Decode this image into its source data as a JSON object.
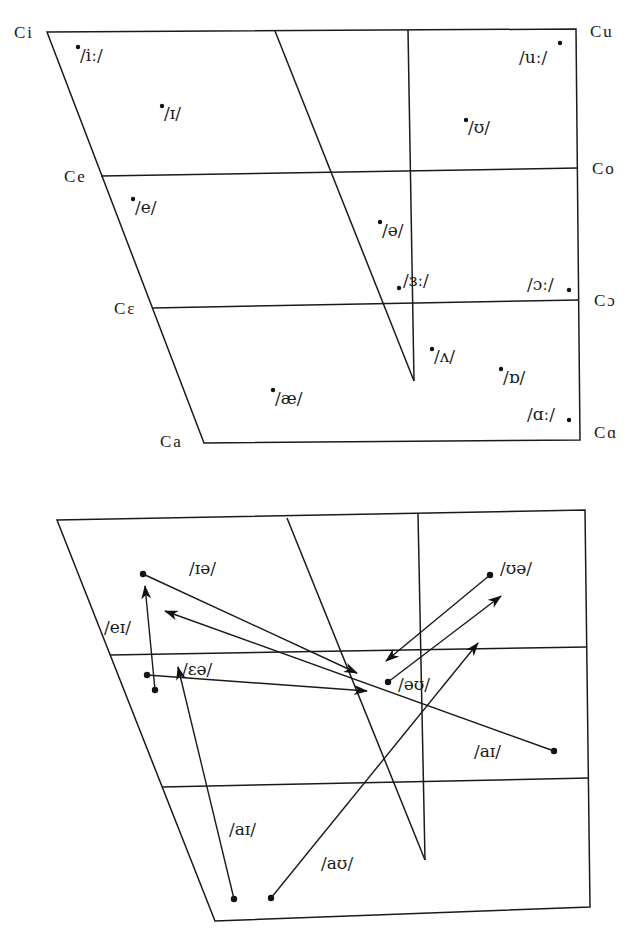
{
  "monophthong_chart": {
    "cardinals": {
      "ci": "Ci",
      "ce": "Ce",
      "cepsilon": "Cε",
      "ca_front": "Ca",
      "cu": "Cu",
      "co": "Co",
      "copen": "Cɔ",
      "ca_back": "Cɑ"
    },
    "vowels": [
      {
        "symbol": "/iː/",
        "x": 78,
        "y": 45
      },
      {
        "symbol": "/ɪ/",
        "x": 162,
        "y": 105
      },
      {
        "symbol": "/e/",
        "x": 132,
        "y": 198
      },
      {
        "symbol": "/ʊ/",
        "x": 465,
        "y": 120
      },
      {
        "symbol": "/uː/",
        "x": 560,
        "y": 43
      },
      {
        "symbol": "/ə/",
        "x": 380,
        "y": 225
      },
      {
        "symbol": "/ɜː/",
        "x": 399,
        "y": 286
      },
      {
        "symbol": "/ɔː/",
        "x": 569,
        "y": 289
      },
      {
        "symbol": "/ʌ/",
        "x": 432,
        "y": 350
      },
      {
        "symbol": "/ɒ/",
        "x": 501,
        "y": 370
      },
      {
        "symbol": "/æ/",
        "x": 273,
        "y": 391
      },
      {
        "symbol": "/ɑː/",
        "x": 569,
        "y": 420
      }
    ]
  },
  "diphthong_chart": {
    "diphthongs": [
      {
        "symbol": "/ɪə/",
        "label_x": 188,
        "label_y": 572
      },
      {
        "symbol": "/eɪ/",
        "label_x": 105,
        "label_y": 630
      },
      {
        "symbol": "/ɛə/",
        "label_x": 183,
        "label_y": 672
      },
      {
        "symbol": "/ʊə/",
        "label_x": 500,
        "label_y": 572
      },
      {
        "symbol": "/əʊ/",
        "label_x": 398,
        "label_y": 688
      },
      {
        "symbol": "/ɔɪ/",
        "label_x": 473,
        "label_y": 756
      },
      {
        "symbol": "/aɪ/",
        "label_x": 228,
        "label_y": 834
      },
      {
        "symbol": "/aʊ/",
        "label_x": 320,
        "label_y": 867
      }
    ]
  }
}
